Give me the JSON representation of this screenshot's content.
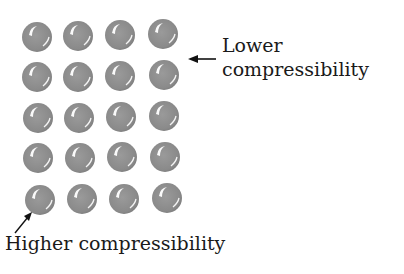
{
  "diagram": {
    "grid": {
      "rows": 5,
      "cols": 4,
      "sphere_color": "#8a8a8a",
      "highlight_color": "#ffffff"
    },
    "labels": {
      "top_line1": "Lower",
      "top_line2": "compressibility",
      "bottom": "Higher compressibility"
    }
  }
}
